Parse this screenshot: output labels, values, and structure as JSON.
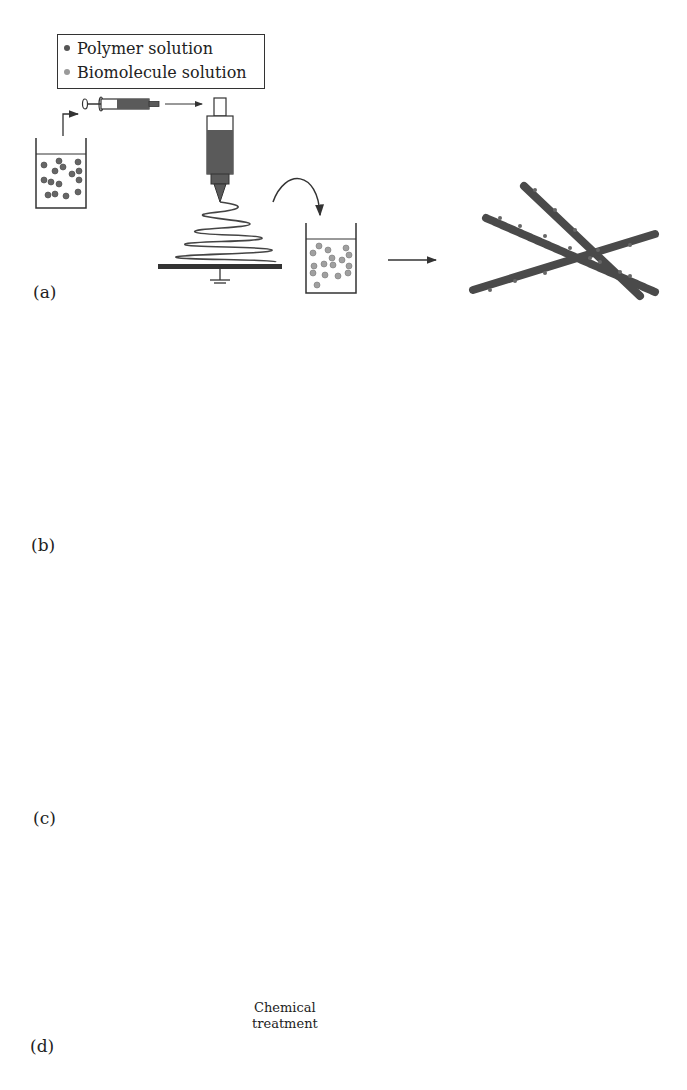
{
  "legend": {
    "items": [
      {
        "label": "Polymer solution",
        "color": "#555555"
      },
      {
        "label": "Biomolecule solution",
        "color": "#9a9a9a"
      }
    ]
  },
  "panels": [
    {
      "label": "(a)",
      "description": "Electrospun polymer fibers immersed in biomolecule solution; biomolecules adsorbed on fiber surface"
    },
    {
      "label": "(b)",
      "description": "Polymer and biomolecule solutions blended, then electrospun; biomolecules dispersed within fibers"
    },
    {
      "label": "(c)",
      "description": "Coaxial electrospinning: biomolecule solution in core, polymer solution in shell"
    },
    {
      "label": "(d)",
      "description": "Electrospun fibers chemically treated, then immersed in biomolecule solution; biomolecules covalently attached"
    }
  ],
  "annotations": {
    "chemical_treatment_line1": "Chemical",
    "chemical_treatment_line2": "treatment"
  },
  "colors": {
    "polymer": "#555555",
    "biomolecule": "#9a9a9a",
    "fiber": "#4a4a4a",
    "line": "#333333"
  }
}
